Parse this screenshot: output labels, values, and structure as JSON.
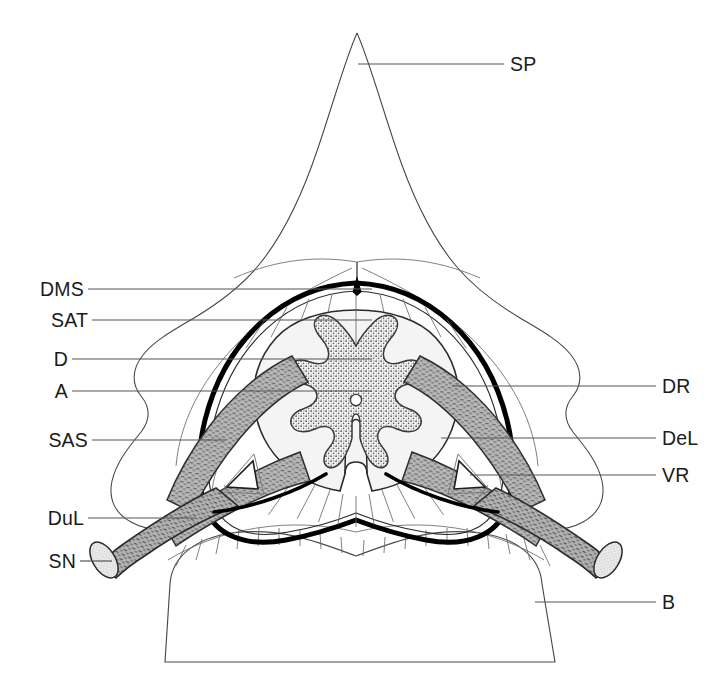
{
  "figure": {
    "type": "anatomical-line-diagram",
    "background": "#ffffff",
    "ink": "#1b1b1b",
    "leader_color": "#555555",
    "dura_color": "#000000",
    "grey_matter_fill": "#c9c9c9",
    "root_fill": "#a9a9a9",
    "white_matter_fill": "#f4f4f4"
  },
  "labels": {
    "left": [
      {
        "key": "DMS",
        "text": "DMS",
        "meaning": "dorsal median septum",
        "x": 120,
        "y": 289,
        "line_to": 372
      },
      {
        "key": "SAT",
        "text": "SAT",
        "meaning": "subarachnoid trabeculae",
        "x": 120,
        "y": 320,
        "line_to": 372
      },
      {
        "key": "D",
        "text": "D",
        "meaning": "dura mater",
        "x": 120,
        "y": 359,
        "line_to": 372
      },
      {
        "key": "A",
        "text": "A",
        "meaning": "arachnoid mater",
        "x": 120,
        "y": 391,
        "line_to": 372
      },
      {
        "key": "SAS",
        "text": "SAS",
        "meaning": "subarachnoid space",
        "x": 120,
        "y": 440,
        "line_to": 226
      },
      {
        "key": "DuL",
        "text": "DuL",
        "meaning": "dural sleeve / root sleeve",
        "x": 120,
        "y": 518,
        "line_to": 196
      },
      {
        "key": "SN",
        "text": "SN",
        "meaning": "spinal nerve",
        "x": 120,
        "y": 561,
        "line_to": 112
      }
    ],
    "right": [
      {
        "key": "SP",
        "text": "SP",
        "meaning": "spinous process",
        "x": 662,
        "y": 64,
        "line_to": 358
      },
      {
        "key": "DR",
        "text": "DR",
        "meaning": "dorsal root",
        "x": 662,
        "y": 386,
        "line_to": 452
      },
      {
        "key": "DeL",
        "text": "DeL",
        "meaning": "denticulate ligament",
        "x": 662,
        "y": 438,
        "line_to": 441
      },
      {
        "key": "VR",
        "text": "VR",
        "meaning": "ventral root",
        "x": 662,
        "y": 475,
        "line_to": 470
      },
      {
        "key": "B",
        "text": "B",
        "meaning": "vertebral body",
        "x": 662,
        "y": 602,
        "line_to": 535
      }
    ]
  },
  "structures": [
    {
      "name": "spinous-process",
      "label_key": "SP"
    },
    {
      "name": "vertebral-body",
      "label_key": "B"
    },
    {
      "name": "dura-mater",
      "label_key": "D"
    },
    {
      "name": "arachnoid-mater",
      "label_key": "A"
    },
    {
      "name": "subarachnoid-space",
      "label_key": "SAS"
    },
    {
      "name": "subarachnoid-trabeculae",
      "label_key": "SAT"
    },
    {
      "name": "dorsal-median-septum",
      "label_key": "DMS"
    },
    {
      "name": "dorsal-root",
      "label_key": "DR"
    },
    {
      "name": "ventral-root",
      "label_key": "VR"
    },
    {
      "name": "denticulate-ligament",
      "label_key": "DeL"
    },
    {
      "name": "dural-sleeve",
      "label_key": "DuL"
    },
    {
      "name": "spinal-nerve",
      "label_key": "SN"
    },
    {
      "name": "grey-matter-butterfly",
      "label_key": null
    },
    {
      "name": "central-canal",
      "label_key": null
    }
  ]
}
